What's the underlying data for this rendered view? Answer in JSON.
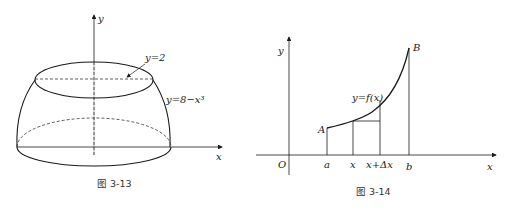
{
  "figures": [
    {
      "caption": "图 3-13",
      "labels": {
        "y_axis": "y",
        "x_axis": "x",
        "top_plane": "y=2",
        "surface_curve": "y=8−x³"
      },
      "description": "Solid of revolution bounded by y=8−x³ and plane y=2, revolved about y-axis"
    },
    {
      "caption": "图 3-14",
      "labels": {
        "y_axis": "y",
        "x_axis": "x",
        "origin": "O",
        "curve": "y=f(x)",
        "point_A": "A",
        "point_B": "B",
        "tick_a": "a",
        "tick_x": "x",
        "tick_x_dx": "x+Δx",
        "tick_b": "b"
      },
      "description": "Arc length element of curve y=f(x) from A to B over [a,b]"
    }
  ],
  "colors": {
    "stroke": "#1a1a1a",
    "background": "#ffffff"
  }
}
